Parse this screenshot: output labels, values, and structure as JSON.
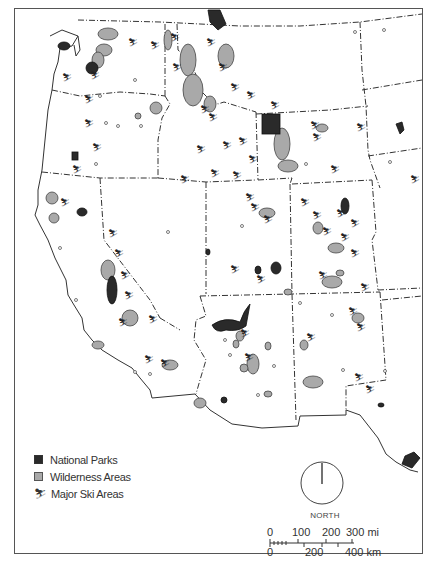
{
  "map": {
    "title": "",
    "region": "Western United States",
    "colors": {
      "national_park": "#2a2a2a",
      "wilderness": "#a9a9a9",
      "outline": "#333333",
      "background": "#ffffff"
    }
  },
  "legend": {
    "items": [
      {
        "label": "National Parks",
        "symbol": "dark-square"
      },
      {
        "label": "Wilderness Areas",
        "symbol": "gray-square"
      },
      {
        "label": "Major Ski Areas",
        "symbol": "skier-icon"
      }
    ]
  },
  "compass": {
    "label": "NORTH"
  },
  "scale": {
    "miles_labels": [
      "0",
      "100",
      "200",
      "300 mi"
    ],
    "km_labels": [
      "0",
      "200",
      "400 km"
    ]
  }
}
